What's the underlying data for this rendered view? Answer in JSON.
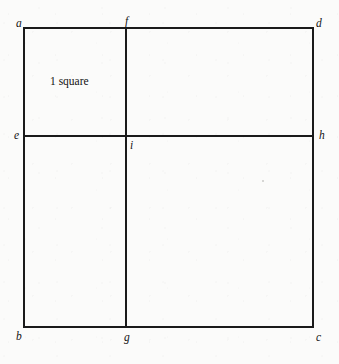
{
  "figure": {
    "kind": "geometric-diagram",
    "background_color": "#fbfbfa",
    "line_color": "#1a1a1a",
    "label_color": "#131313",
    "outer_square": {
      "left": 24,
      "top": 28,
      "right": 313,
      "bottom": 327,
      "width": 289,
      "height": 299,
      "stroke_width": 1.6
    },
    "interior_lines": [
      {
        "name": "vertical-segment-f-g",
        "orientation": "vertical",
        "x": 126,
        "y1": 28,
        "y2": 327,
        "endpoints": [
          "f",
          "g"
        ],
        "stroke_width": 1.3
      },
      {
        "name": "horizontal-segment-e-h",
        "orientation": "horizontal",
        "y": 136,
        "x1": 24,
        "x2": 313,
        "endpoints": [
          "e",
          "h"
        ],
        "stroke_width": 1.3
      }
    ],
    "vertices": [
      {
        "id": "a",
        "label": "a",
        "role": "outer-corner",
        "position": "top-left",
        "x": 24,
        "y": 28
      },
      {
        "id": "f",
        "label": "f",
        "role": "edge-point",
        "position": "top-edge",
        "x": 126,
        "y": 28
      },
      {
        "id": "d",
        "label": "d",
        "role": "outer-corner",
        "position": "top-right",
        "x": 313,
        "y": 28
      },
      {
        "id": "e",
        "label": "e",
        "role": "edge-point",
        "position": "left-edge",
        "x": 24,
        "y": 136
      },
      {
        "id": "i",
        "label": "i",
        "role": "interior-crossing",
        "position": "center",
        "x": 126,
        "y": 136
      },
      {
        "id": "h",
        "label": "h",
        "role": "edge-point",
        "position": "right-edge",
        "x": 313,
        "y": 136
      },
      {
        "id": "b",
        "label": "b",
        "role": "outer-corner",
        "position": "bottom-left",
        "x": 24,
        "y": 327
      },
      {
        "id": "g",
        "label": "g",
        "role": "edge-point",
        "position": "bottom-edge",
        "x": 126,
        "y": 327
      },
      {
        "id": "c",
        "label": "c",
        "role": "outer-corner",
        "position": "bottom-right",
        "x": 313,
        "y": 327
      }
    ],
    "annotations": [
      {
        "id": "one-square",
        "text": "1 square",
        "region": "upper-left rectangle a f i e",
        "x": 50,
        "y": 76
      }
    ],
    "marks": [
      {
        "id": "scan-speck",
        "kind": "artifact",
        "x": 262,
        "y": 180
      }
    ]
  }
}
